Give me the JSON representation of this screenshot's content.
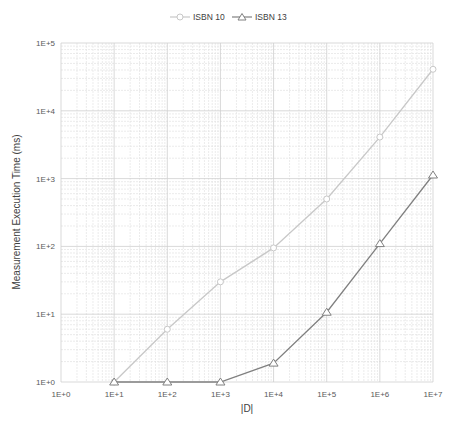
{
  "chart_data": {
    "type": "line",
    "title": "",
    "xlabel": "|D|",
    "ylabel": "Measurement Execution Time (ms)",
    "x_scale": "log",
    "y_scale": "log",
    "x": [
      10,
      100,
      1000,
      10000,
      100000,
      1000000,
      10000000
    ],
    "x_tick_labels": [
      "1E+0",
      "1E+1",
      "1E+2",
      "1E+3",
      "1E+4",
      "1E+5",
      "1E+6",
      "1E+7"
    ],
    "y_tick_labels": [
      "1E+0",
      "1E+1",
      "1E+2",
      "1E+3",
      "1E+4",
      "1E+5"
    ],
    "xlim": [
      1,
      10000000
    ],
    "ylim": [
      1,
      100000
    ],
    "grid": true,
    "legend_position": "top",
    "series": [
      {
        "name": "ISBN 10",
        "marker": "circle",
        "color": "#c8c8c8",
        "values": [
          1,
          6,
          30,
          95,
          500,
          4100,
          41000
        ]
      },
      {
        "name": "ISBN 13",
        "marker": "triangle",
        "color": "#808080",
        "values": [
          1,
          1,
          1,
          1.9,
          10.7,
          110,
          1130
        ]
      }
    ]
  },
  "legend": {
    "items": [
      {
        "label": "ISBN 10"
      },
      {
        "label": "ISBN 13"
      }
    ]
  },
  "axes": {
    "x_title": "|D|",
    "y_title": "Measurement Execution Time (ms)"
  }
}
